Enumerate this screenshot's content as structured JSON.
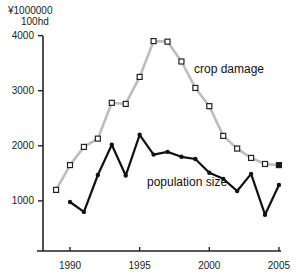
{
  "chart_data": {
    "type": "line",
    "title": "",
    "xlabel": "",
    "ylabel": "¥1000000 / 100hd",
    "y_unit_line1": "¥1000000",
    "y_unit_line2": "100hd",
    "ylim": [
      0,
      4000
    ],
    "xlim": [
      1988,
      2005
    ],
    "yticks": [
      1000,
      2000,
      3000,
      4000
    ],
    "ytick_labels": [
      "1000",
      "2000",
      "3000",
      "4000"
    ],
    "xticks": [
      1990,
      1995,
      2000,
      2005
    ],
    "xtick_labels": [
      "1990",
      "1995",
      "2000",
      "2005"
    ],
    "grid": false,
    "legend": "inline labels",
    "series": [
      {
        "name": "crop damage",
        "color": "#bdbdbd",
        "marker": "open-square",
        "x": [
          1989,
          1990,
          1991,
          1992,
          1993,
          1994,
          1995,
          1996,
          1997,
          1998,
          1999,
          2000,
          2001,
          2002,
          2003,
          2004,
          2005
        ],
        "values": [
          1200,
          1650,
          1980,
          2130,
          2780,
          2760,
          3250,
          3900,
          3890,
          3530,
          3050,
          2720,
          2180,
          1950,
          1780,
          1670,
          1650
        ]
      },
      {
        "name": "population size",
        "color": "#111111",
        "marker": "dot",
        "x": [
          1990,
          1991,
          1992,
          1993,
          1994,
          1995,
          1996,
          1997,
          1998,
          1999,
          2000,
          2001,
          2002,
          2003,
          2004,
          2005
        ],
        "values": [
          980,
          800,
          1470,
          2020,
          1460,
          2200,
          1840,
          1890,
          1800,
          1760,
          1510,
          1400,
          1180,
          1490,
          750,
          1290
        ]
      }
    ],
    "annotations": [
      {
        "text": "crop damage",
        "x": 1998.5,
        "y": 3400
      },
      {
        "text": "population size",
        "x": 1996.3,
        "y": 1470
      }
    ]
  }
}
